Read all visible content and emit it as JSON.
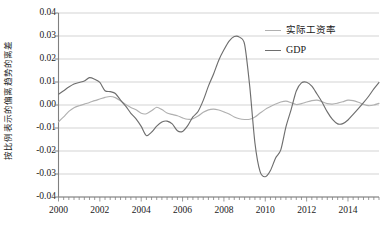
{
  "chart_data": {
    "type": "line",
    "title": "",
    "subtitle": "",
    "xlabel": "",
    "ylabel": "按比例表示的偏离趋势的离差",
    "xlim": [
      2000.0,
      2015.5
    ],
    "ylim": [
      -0.04,
      0.04
    ],
    "grid": true,
    "grid_axis": "y",
    "legend_position": "top-right",
    "y_ticks": [
      "0.04",
      "0.03",
      "0.02",
      "0.01",
      "0.00",
      "-0.01",
      "-0.02",
      "-0.03",
      "-0.04"
    ],
    "y_tick_values": [
      0.04,
      0.03,
      0.02,
      0.01,
      0.0,
      -0.01,
      -0.02,
      -0.03,
      -0.04
    ],
    "x_ticks": [
      "2000",
      "2002",
      "2004",
      "2006",
      "2008",
      "2010",
      "2012",
      "2014"
    ],
    "x_tick_values": [
      2000,
      2002,
      2004,
      2006,
      2008,
      2010,
      2012,
      2014
    ],
    "x_minor_tick_interval": 0.25,
    "colors": {
      "real_wage_rate": "#b0b0b0",
      "gdp": "#6e6e6e",
      "axis": "#808080",
      "gridline": "#c8c8c8",
      "text": "#1a1a1a"
    },
    "series": [
      {
        "name": "实际工资率",
        "color": "#b0b0b0",
        "x": [
          2000.0,
          2000.25,
          2000.5,
          2000.75,
          2001.0,
          2001.25,
          2001.5,
          2001.75,
          2002.0,
          2002.25,
          2002.5,
          2002.75,
          2003.0,
          2003.25,
          2003.5,
          2003.75,
          2004.0,
          2004.25,
          2004.5,
          2004.75,
          2005.0,
          2005.25,
          2005.5,
          2005.75,
          2006.0,
          2006.25,
          2006.5,
          2006.75,
          2007.0,
          2007.25,
          2007.5,
          2007.75,
          2008.0,
          2008.25,
          2008.5,
          2008.75,
          2009.0,
          2009.25,
          2009.5,
          2009.75,
          2010.0,
          2010.25,
          2010.5,
          2010.75,
          2011.0,
          2011.25,
          2011.5,
          2011.75,
          2012.0,
          2012.25,
          2012.5,
          2012.75,
          2013.0,
          2013.25,
          2013.5,
          2013.75,
          2014.0,
          2014.25,
          2014.5,
          2014.75,
          2015.0,
          2015.25,
          2015.5
        ],
        "values": [
          -0.0073,
          -0.0052,
          -0.0028,
          -0.0012,
          -0.0003,
          0.0004,
          0.0011,
          0.0019,
          0.0026,
          0.0033,
          0.0037,
          0.0032,
          0.0018,
          0.0002,
          -0.0011,
          -0.0021,
          -0.0036,
          -0.0038,
          -0.0025,
          -0.001,
          -0.002,
          -0.0035,
          -0.0041,
          -0.0047,
          -0.0056,
          -0.0062,
          -0.006,
          -0.0048,
          -0.0032,
          -0.0021,
          -0.0018,
          -0.0022,
          -0.003,
          -0.0039,
          -0.0052,
          -0.006,
          -0.0063,
          -0.0062,
          -0.0052,
          -0.0035,
          -0.0019,
          -0.0007,
          0.0004,
          0.0013,
          0.0017,
          0.001,
          0.0002,
          0.0006,
          0.0013,
          0.0019,
          0.0021,
          0.0014,
          0.0006,
          0.0004,
          0.0008,
          0.0014,
          0.0021,
          0.0019,
          0.0012,
          0.0003,
          -0.0003,
          0.0,
          0.0007
        ]
      },
      {
        "name": "GDP",
        "color": "#6e6e6e",
        "x": [
          2000.0,
          2000.25,
          2000.5,
          2000.75,
          2001.0,
          2001.25,
          2001.5,
          2001.75,
          2002.0,
          2002.25,
          2002.5,
          2002.75,
          2003.0,
          2003.25,
          2003.5,
          2003.75,
          2004.0,
          2004.25,
          2004.5,
          2004.75,
          2005.0,
          2005.25,
          2005.5,
          2005.75,
          2006.0,
          2006.25,
          2006.5,
          2006.75,
          2007.0,
          2007.25,
          2007.5,
          2007.75,
          2008.0,
          2008.25,
          2008.5,
          2008.75,
          2009.0,
          2009.25,
          2009.5,
          2009.75,
          2010.0,
          2010.25,
          2010.5,
          2010.75,
          2011.0,
          2011.25,
          2011.5,
          2011.75,
          2012.0,
          2012.25,
          2012.5,
          2012.75,
          2013.0,
          2013.25,
          2013.5,
          2013.75,
          2014.0,
          2014.25,
          2014.5,
          2014.75,
          2015.0,
          2015.25,
          2015.5
        ],
        "values": [
          0.0047,
          0.0062,
          0.0078,
          0.0091,
          0.0098,
          0.0104,
          0.0119,
          0.0112,
          0.0098,
          0.0062,
          0.0058,
          0.005,
          0.0021,
          -0.0005,
          -0.0036,
          -0.006,
          -0.0093,
          -0.0133,
          -0.0118,
          -0.0092,
          -0.0074,
          -0.007,
          -0.0082,
          -0.0112,
          -0.0115,
          -0.009,
          -0.0052,
          -0.0028,
          0.002,
          0.0082,
          0.0135,
          0.0195,
          0.024,
          0.0278,
          0.0298,
          0.0295,
          0.0264,
          0.008,
          -0.0165,
          -0.029,
          -0.0312,
          -0.0285,
          -0.023,
          -0.0195,
          -0.0095,
          -0.002,
          0.0061,
          0.0096,
          0.0099,
          0.0082,
          0.0048,
          0.0012,
          -0.003,
          -0.0063,
          -0.0082,
          -0.0081,
          -0.0065,
          -0.0041,
          -0.0016,
          0.001,
          0.0038,
          0.007,
          0.0098
        ]
      }
    ]
  },
  "legend": {
    "items": [
      {
        "label": "实际工资率",
        "script": "cjk"
      },
      {
        "label": "GDP",
        "script": "latin"
      }
    ]
  },
  "axes": {
    "y_title": "按比例表示的偏离趋势的离差"
  }
}
